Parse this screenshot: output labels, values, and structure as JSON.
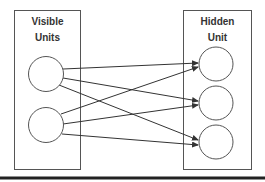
{
  "diagram": {
    "left_group": {
      "label_line1": "Visible",
      "label_line2": "Units",
      "node_count": 2
    },
    "right_group": {
      "label_line1": "Hidden",
      "label_line2": "Unit",
      "node_count": 3
    },
    "connections": "fully connected: each visible unit -> each hidden unit (6 directed edges)",
    "colors": {
      "stroke": "#555555",
      "edge": "#333333",
      "rule": "#222222",
      "background": "#ffffff"
    }
  }
}
